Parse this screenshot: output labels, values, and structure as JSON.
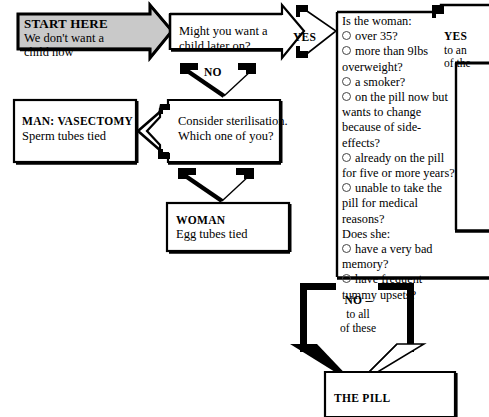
{
  "diagram": {
    "background": "#ffffff",
    "ink": "#000000",
    "highlight_fill": "#c9c9c9"
  },
  "nodes": {
    "start": {
      "heading": "START HERE",
      "line1": "We don't want a",
      "line2": "child now"
    },
    "later_child": {
      "line1": "Might you want a",
      "line2": "child later on?"
    },
    "vasectomy": {
      "heading": "MAN: VASECTOMY",
      "line1": "Sperm tubes tied"
    },
    "sterilisation": {
      "line1": "Consider sterilisation.",
      "line2": "Which one of you?"
    },
    "woman": {
      "heading": "WOMAN",
      "line1": "Egg tubes tied"
    },
    "the_pill": {
      "heading": "THE PILL"
    },
    "woman_questions": {
      "prompt_1": "Is the woman:",
      "items_1": [
        "over 35?",
        "more than 9lbs overweight?",
        "a smoker?",
        "on the pill now but wants to change because of side-effects?",
        "already on the pill for five or more years?",
        "unable to take the pill for medical reasons?"
      ],
      "wrapped_lines_1": [
        [
          "over 35?"
        ],
        [
          "more than 9lbs",
          "overweight?"
        ],
        [
          "a smoker?"
        ],
        [
          "on the pill now but",
          "wants to change",
          "because of side-",
          "effects?"
        ],
        [
          "already on the pill",
          "for five or more years?"
        ],
        [
          "unable to take the",
          "pill for medical",
          "reasons?"
        ]
      ],
      "prompt_2": "Does she:",
      "items_2": [
        "have a very bad memory?",
        "have frequent tummy upsets?"
      ],
      "wrapped_lines_2": [
        [
          "have a very bad",
          "memory?"
        ],
        [
          "have frequent",
          "tummy upsets?"
        ]
      ]
    }
  },
  "edges": {
    "yes_later_child": "YES",
    "no_later_child": "NO",
    "yes_questions_line1": "YES",
    "yes_questions_line2": "to an",
    "yes_questions_line3": "of the",
    "no_all_line1": "NO –",
    "no_all_line2": "to all",
    "no_all_line3": "of these"
  }
}
